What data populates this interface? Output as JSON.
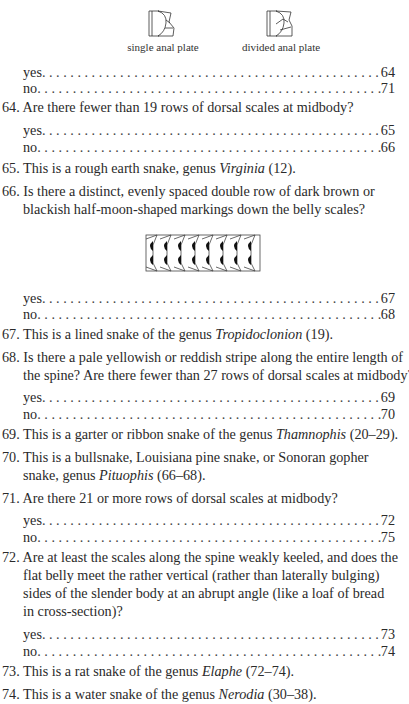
{
  "figures": {
    "single": {
      "caption": "single anal plate"
    },
    "divided": {
      "caption": "divided anal plate"
    }
  },
  "top_choices": [
    {
      "label": "yes",
      "target": "64"
    },
    {
      "label": "no",
      "target": "71"
    }
  ],
  "entries": {
    "q64": {
      "number": "64.",
      "text": "Are there fewer than 19 rows of dorsal scales at midbody?",
      "choices": [
        {
          "label": "yes",
          "target": "65"
        },
        {
          "label": "no",
          "target": "66"
        }
      ]
    },
    "q65": {
      "number": "65.",
      "pre": "This is a rough earth snake, genus ",
      "genus": "Virginia",
      "post": " (12)."
    },
    "q66": {
      "number": "66.",
      "line1": "Is there a distinct, evenly spaced double row of dark brown or",
      "line2": "blackish half-moon-shaped markings down the belly scales?",
      "choices": [
        {
          "label": "yes",
          "target": "67"
        },
        {
          "label": "no",
          "target": "68"
        }
      ]
    },
    "q67": {
      "number": "67.",
      "pre": "This is a lined snake of the genus ",
      "genus": "Tropidoclonion",
      "post": " (19)."
    },
    "q68": {
      "number": "68.",
      "line1": "Is there a pale yellowish or reddish stripe along the entire length of",
      "line2": "the spine? Are there fewer than 27 rows of dorsal scales at midbody?",
      "choices": [
        {
          "label": "yes",
          "target": "69"
        },
        {
          "label": "no",
          "target": "70"
        }
      ]
    },
    "q69": {
      "number": "69.",
      "pre": "This is a garter or ribbon snake of the genus ",
      "genus": "Thamnophis",
      "post": " (20–29)."
    },
    "q70": {
      "number": "70.",
      "line1": "This is a bullsnake, Louisiana pine snake, or Sonoran gopher",
      "pre2": "snake, genus ",
      "genus": "Pituophis",
      "post": " (66–68)."
    },
    "q71": {
      "number": "71.",
      "text": "Are there 21 or more rows of dorsal scales at midbody?",
      "choices": [
        {
          "label": "yes",
          "target": "72"
        },
        {
          "label": "no",
          "target": "75"
        }
      ]
    },
    "q72": {
      "number": "72.",
      "line1": "Are at least the scales along the spine weakly keeled, and does the",
      "line2": "flat belly meet the rather vertical (rather than laterally bulging)",
      "line3": "sides of the slender body at an abrupt angle (like a loaf of bread",
      "line4": "in cross-section)?",
      "choices": [
        {
          "label": "yes",
          "target": "73"
        },
        {
          "label": "no",
          "target": "74"
        }
      ]
    },
    "q73": {
      "number": "73.",
      "pre": "This is a rat snake of the genus ",
      "genus": "Elaphe",
      "post": " (72–74)."
    },
    "q74": {
      "number": "74.",
      "pre": "This is a water snake of the genus ",
      "genus": "Nerodia",
      "post": " (30–38)."
    }
  }
}
